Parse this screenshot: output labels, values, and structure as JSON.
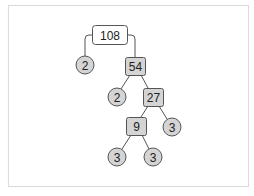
{
  "diagram": {
    "type": "factor-tree",
    "root": "108",
    "nodes": [
      {
        "id": "n108",
        "label": "108",
        "kind": "composite-root"
      },
      {
        "id": "n2a",
        "label": "2",
        "kind": "prime"
      },
      {
        "id": "n54",
        "label": "54",
        "kind": "composite"
      },
      {
        "id": "n2b",
        "label": "2",
        "kind": "prime"
      },
      {
        "id": "n27",
        "label": "27",
        "kind": "composite"
      },
      {
        "id": "n9",
        "label": "9",
        "kind": "composite"
      },
      {
        "id": "n3a",
        "label": "3",
        "kind": "prime"
      },
      {
        "id": "n3b",
        "label": "3",
        "kind": "prime"
      },
      {
        "id": "n3c",
        "label": "3",
        "kind": "prime"
      }
    ],
    "edges": [
      [
        "108",
        "2"
      ],
      [
        "108",
        "54"
      ],
      [
        "54",
        "2"
      ],
      [
        "54",
        "27"
      ],
      [
        "27",
        "9"
      ],
      [
        "27",
        "3"
      ],
      [
        "9",
        "3"
      ],
      [
        "9",
        "3"
      ]
    ],
    "colors": {
      "root_fill": "#ffffff",
      "node_fill": "#d4d4d4",
      "stroke": "#555555",
      "frame_border": "#dcdcdc"
    }
  }
}
